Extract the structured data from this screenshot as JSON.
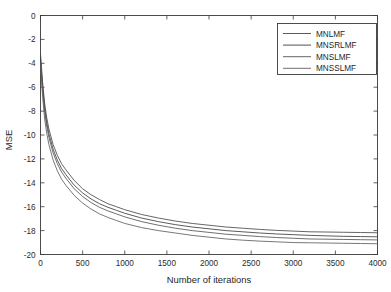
{
  "chart_data": {
    "type": "line",
    "title": "",
    "xlabel": "Number of iterations",
    "ylabel": "MSE",
    "xlim": [
      0,
      4000
    ],
    "ylim": [
      -20,
      0
    ],
    "xticks": [
      0,
      500,
      1000,
      1500,
      2000,
      2500,
      3000,
      3500,
      4000
    ],
    "yticks": [
      0,
      -2,
      -4,
      -6,
      -8,
      -10,
      -12,
      -14,
      -16,
      -18,
      -20
    ],
    "xtick_labels": [
      "0",
      "500",
      "1000",
      "1500",
      "2000",
      "2500",
      "3000",
      "3500",
      "4000"
    ],
    "ytick_labels": [
      "0",
      "-2",
      "-4",
      "-6",
      "-8",
      "-10",
      "-12",
      "-14",
      "-16",
      "-18",
      "-20"
    ],
    "grid": false,
    "legend_position": "upper right",
    "legend_entries": [
      "MNLMF",
      "MNSRLMF",
      "MNSLMF",
      "MNSSLMF"
    ],
    "x": [
      0,
      25,
      50,
      75,
      100,
      150,
      200,
      250,
      300,
      400,
      500,
      600,
      700,
      800,
      900,
      1000,
      1200,
      1400,
      1600,
      1800,
      2000,
      2200,
      2400,
      2600,
      2800,
      3000,
      3200,
      3400,
      3600,
      3800,
      4000
    ],
    "series": [
      {
        "name": "MNLMF",
        "color": "#4a4a4a",
        "values": [
          -3.2,
          -5.6,
          -7.4,
          -8.6,
          -9.5,
          -10.8,
          -11.7,
          -12.4,
          -12.9,
          -13.8,
          -14.5,
          -15.0,
          -15.4,
          -15.75,
          -16.0,
          -16.25,
          -16.65,
          -16.95,
          -17.2,
          -17.4,
          -17.55,
          -17.7,
          -17.8,
          -17.9,
          -17.98,
          -18.04,
          -18.1,
          -18.12,
          -18.14,
          -18.16,
          -18.18
        ]
      },
      {
        "name": "MNSRLMF",
        "color": "#3d3d3d",
        "values": [
          -3.6,
          -6.0,
          -7.8,
          -9.0,
          -9.9,
          -11.2,
          -12.1,
          -12.8,
          -13.3,
          -14.2,
          -14.85,
          -15.35,
          -15.75,
          -16.05,
          -16.3,
          -16.55,
          -16.95,
          -17.25,
          -17.5,
          -17.7,
          -17.85,
          -18.0,
          -18.1,
          -18.2,
          -18.28,
          -18.34,
          -18.4,
          -18.44,
          -18.48,
          -18.5,
          -18.52
        ]
      },
      {
        "name": "MNSLMF",
        "color": "#555555",
        "values": [
          -3.9,
          -6.3,
          -8.1,
          -9.3,
          -10.2,
          -11.5,
          -12.4,
          -13.1,
          -13.6,
          -14.5,
          -15.15,
          -15.65,
          -16.05,
          -16.35,
          -16.6,
          -16.85,
          -17.25,
          -17.55,
          -17.8,
          -18.0,
          -18.15,
          -18.3,
          -18.4,
          -18.5,
          -18.58,
          -18.64,
          -18.7,
          -18.72,
          -18.74,
          -18.76,
          -18.78
        ]
      },
      {
        "name": "MNSSLMF",
        "color": "#5f5f5f",
        "values": [
          -4.2,
          -6.8,
          -8.7,
          -9.9,
          -10.8,
          -12.1,
          -13.0,
          -13.7,
          -14.2,
          -15.05,
          -15.7,
          -16.2,
          -16.6,
          -16.9,
          -17.15,
          -17.4,
          -17.75,
          -18.0,
          -18.2,
          -18.4,
          -18.55,
          -18.7,
          -18.8,
          -18.88,
          -18.94,
          -19.0,
          -19.02,
          -19.04,
          -19.06,
          -19.08,
          -19.1
        ]
      }
    ]
  },
  "axes": {
    "ylabel": "MSE",
    "xlabel": "Number of iterations"
  },
  "legend": {
    "items": [
      {
        "label": "MNLMF"
      },
      {
        "label": "MNSRLMF"
      },
      {
        "label": "MNSLMF"
      },
      {
        "label": "MNSSLMF"
      }
    ]
  }
}
